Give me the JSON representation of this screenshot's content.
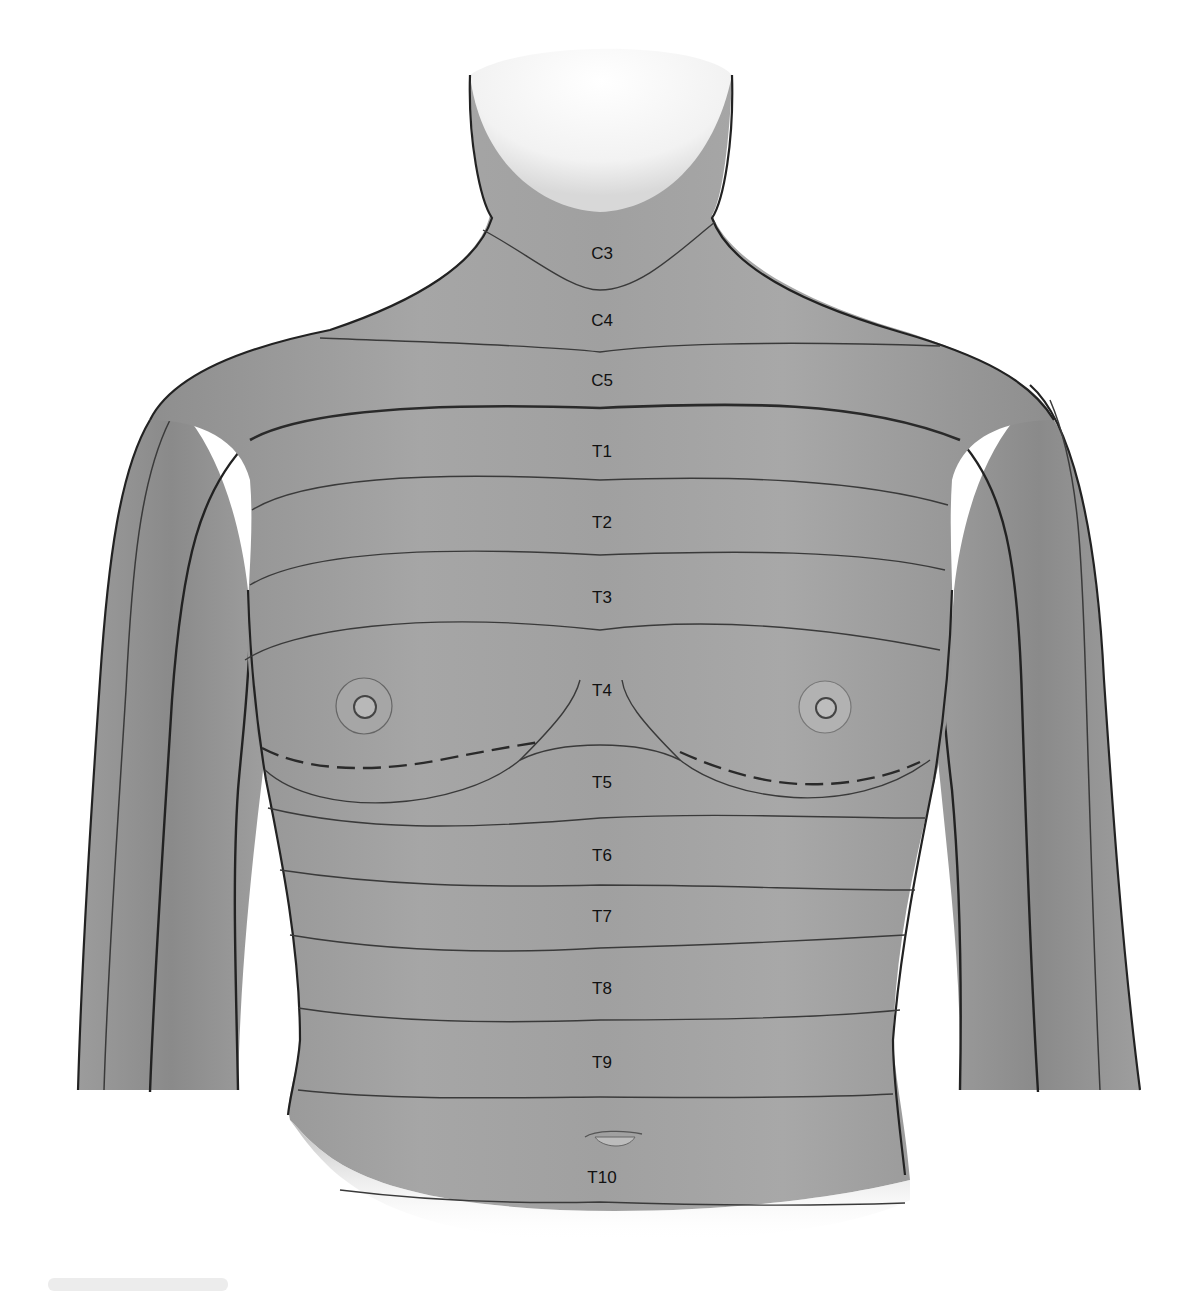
{
  "figure": {
    "colors": {
      "skin": "#9a9a9a",
      "skin_light": "#b4b4b4",
      "skin_dark": "#7e7e7e",
      "line": "#2a2a2a",
      "background": "#ffffff",
      "label_text": "#111111"
    },
    "dermatomes": [
      {
        "label": "C3",
        "x": 602,
        "y": 253
      },
      {
        "label": "C4",
        "x": 602,
        "y": 320
      },
      {
        "label": "C5",
        "x": 602,
        "y": 380
      },
      {
        "label": "T1",
        "x": 602,
        "y": 451
      },
      {
        "label": "T2",
        "x": 602,
        "y": 522
      },
      {
        "label": "T3",
        "x": 602,
        "y": 597
      },
      {
        "label": "T4",
        "x": 602,
        "y": 690
      },
      {
        "label": "T5",
        "x": 602,
        "y": 782
      },
      {
        "label": "T6",
        "x": 602,
        "y": 855
      },
      {
        "label": "T7",
        "x": 602,
        "y": 916
      },
      {
        "label": "T8",
        "x": 602,
        "y": 988
      },
      {
        "label": "T9",
        "x": 602,
        "y": 1062
      },
      {
        "label": "T10",
        "x": 602,
        "y": 1177
      }
    ]
  }
}
